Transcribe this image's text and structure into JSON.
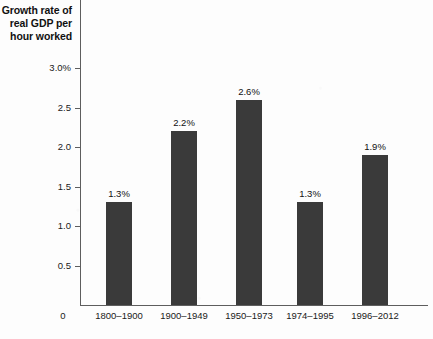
{
  "figure": {
    "title_lines": [
      "Growth rate of",
      "real GDP per",
      "hour worked"
    ],
    "origin_label": "0",
    "bar_color": "#3a3a3a",
    "axis_color": "#5e5e5e",
    "background_color": "#fdfdfd"
  },
  "chart_data": {
    "type": "bar",
    "title": "Growth rate of real GDP per hour worked",
    "xlabel": "",
    "ylabel": "Growth rate of real GDP per hour worked",
    "categories": [
      "1800–1900",
      "1900–1949",
      "1950–1973",
      "1974–1995",
      "1996–2012"
    ],
    "values": [
      1.3,
      2.2,
      2.6,
      1.3,
      1.9
    ],
    "data_labels": [
      "1.3%",
      "2.2%",
      "2.6%",
      "1.3%",
      "1.9%"
    ],
    "ylim": [
      0,
      3.0
    ],
    "ytick_values": [
      0,
      0.5,
      1.0,
      1.5,
      2.0,
      2.5,
      3.0
    ],
    "ytick_labels": [
      "0",
      "0.5",
      "1.0",
      "1.5",
      "2.0",
      "2.5",
      "3.0%"
    ],
    "grid": false,
    "legend": null,
    "units": "percent"
  }
}
